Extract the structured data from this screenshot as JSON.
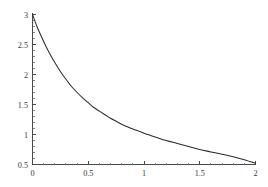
{
  "chart_data": {
    "type": "line",
    "title": "",
    "subtitle": "",
    "xlabel": "",
    "ylabel": "",
    "xlim": [
      0,
      2
    ],
    "ylim": [
      0.5,
      3
    ],
    "grid": false,
    "legend": null,
    "x_ticks": [
      {
        "value": 0,
        "label": "0"
      },
      {
        "value": 0.5,
        "label": "0.5"
      },
      {
        "value": 1,
        "label": "1"
      },
      {
        "value": 1.5,
        "label": "1.5"
      },
      {
        "value": 2,
        "label": "2"
      }
    ],
    "y_ticks": [
      {
        "value": 0.5,
        "label": "0.5"
      },
      {
        "value": 1,
        "label": "1"
      },
      {
        "value": 1.5,
        "label": "1.5"
      },
      {
        "value": 2,
        "label": "2"
      },
      {
        "value": 2.5,
        "label": "2.5"
      },
      {
        "value": 3,
        "label": "3"
      }
    ],
    "x_minor_ticks": [
      0.1,
      0.2,
      0.3,
      0.4,
      0.6,
      0.7,
      0.8,
      0.9,
      1.1,
      1.2,
      1.3,
      1.4,
      1.6,
      1.7,
      1.8,
      1.9
    ],
    "y_minor_ticks": [
      0.6,
      0.7,
      0.8,
      0.9,
      1.1,
      1.2,
      1.3,
      1.4,
      1.6,
      1.7,
      1.8,
      1.9,
      2.1,
      2.2,
      2.3,
      2.4,
      2.6,
      2.7,
      2.8,
      2.9
    ],
    "series": [
      {
        "name": "decay-curve",
        "color": "#2b2b2b",
        "x": [
          0,
          0.04,
          0.08,
          0.12,
          0.16,
          0.2,
          0.25,
          0.3,
          0.35,
          0.4,
          0.45,
          0.5,
          0.55,
          0.6,
          0.65,
          0.7,
          0.75,
          0.8,
          0.85,
          0.9,
          0.95,
          1.0,
          1.1,
          1.2,
          1.3,
          1.4,
          1.5,
          1.6,
          1.7,
          1.8,
          1.9,
          2.0
        ],
        "y": [
          3.0,
          2.8,
          2.63,
          2.47,
          2.33,
          2.2,
          2.05,
          1.92,
          1.8,
          1.7,
          1.61,
          1.53,
          1.45,
          1.39,
          1.33,
          1.27,
          1.22,
          1.17,
          1.13,
          1.09,
          1.06,
          1.02,
          0.96,
          0.9,
          0.85,
          0.8,
          0.75,
          0.71,
          0.67,
          0.63,
          0.58,
          0.52
        ]
      }
    ],
    "axis_color": "#4a4a4a",
    "background_color": "#ffffff"
  },
  "plot": {
    "description": "Exponential decay curve plot"
  }
}
